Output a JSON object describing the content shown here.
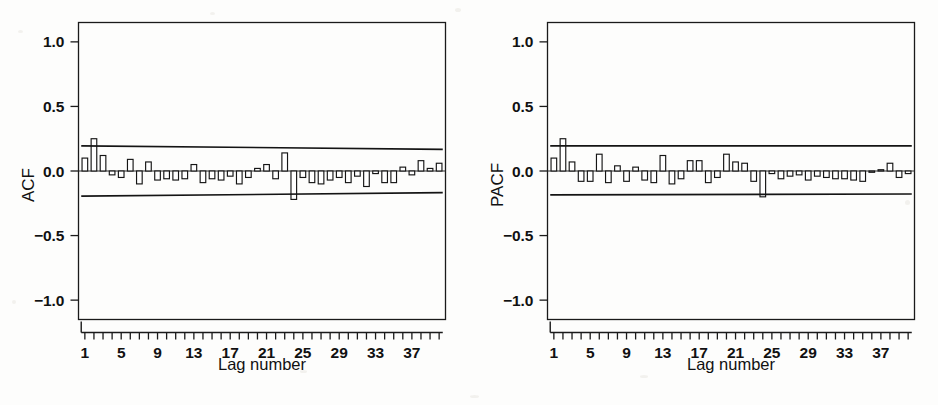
{
  "figure": {
    "background_color": "#fdfdfc",
    "ink_color": "#151515",
    "panel_count": 2
  },
  "chart_data": [
    {
      "type": "bar",
      "name": "acf",
      "title": "",
      "xlabel": "Lag number",
      "ylabel": "ACF",
      "ylim": [
        -1.15,
        1.15
      ],
      "ytick_values": [
        1.0,
        0.5,
        0.0,
        -0.5,
        -1.0
      ],
      "ytick_labels": [
        "1.0",
        "0.5",
        "0.0",
        "-0.5",
        "-1.0"
      ],
      "xlim": [
        0.3,
        40.7
      ],
      "xtick_values": [
        1,
        5,
        9,
        13,
        17,
        21,
        25,
        29,
        33,
        37
      ],
      "xtick_labels": [
        "1",
        "5",
        "9",
        "13",
        "17",
        "21",
        "25",
        "29",
        "33",
        "37"
      ],
      "minor_xticks_every": 1,
      "n_lags": 40,
      "grid": false,
      "legend": false,
      "zero_line": true,
      "confidence_band": {
        "label": "upper and lower confidence limits",
        "upper_start": 0.195,
        "upper_end": 0.168,
        "lower_start": -0.195,
        "lower_end": -0.168
      },
      "categories": [
        1,
        2,
        3,
        4,
        5,
        6,
        7,
        8,
        9,
        10,
        11,
        12,
        13,
        14,
        15,
        16,
        17,
        18,
        19,
        20,
        21,
        22,
        23,
        24,
        25,
        26,
        27,
        28,
        29,
        30,
        31,
        32,
        33,
        34,
        35,
        36,
        37,
        38,
        39,
        40
      ],
      "values": [
        0.1,
        0.25,
        0.12,
        -0.03,
        -0.05,
        0.09,
        -0.1,
        0.07,
        -0.07,
        -0.06,
        -0.07,
        -0.06,
        0.05,
        -0.09,
        -0.06,
        -0.07,
        -0.04,
        -0.1,
        -0.05,
        0.02,
        0.05,
        -0.06,
        0.14,
        -0.22,
        -0.05,
        -0.09,
        -0.1,
        -0.07,
        -0.05,
        -0.09,
        -0.04,
        -0.12,
        -0.02,
        -0.09,
        -0.09,
        0.03,
        -0.03,
        0.08,
        0.02,
        0.06
      ]
    },
    {
      "type": "bar",
      "name": "pacf",
      "title": "",
      "xlabel": "Lag number",
      "ylabel": "PACF",
      "ylim": [
        -1.15,
        1.15
      ],
      "ytick_values": [
        1.0,
        0.5,
        0.0,
        -0.5,
        -1.0
      ],
      "ytick_labels": [
        "1.0",
        "0.5",
        "0.0",
        "-0.5",
        "-1.0"
      ],
      "xlim": [
        0.3,
        40.7
      ],
      "xtick_values": [
        1,
        5,
        9,
        13,
        17,
        21,
        25,
        29,
        33,
        37
      ],
      "xtick_labels": [
        "1",
        "5",
        "9",
        "13",
        "17",
        "21",
        "25",
        "29",
        "33",
        "37"
      ],
      "minor_xticks_every": 1,
      "n_lags": 40,
      "grid": false,
      "legend": false,
      "zero_line": true,
      "confidence_band": {
        "label": "upper and lower confidence limits",
        "upper_start": 0.195,
        "upper_end": 0.195,
        "lower_start": -0.185,
        "lower_end": -0.178
      },
      "categories": [
        1,
        2,
        3,
        4,
        5,
        6,
        7,
        8,
        9,
        10,
        11,
        12,
        13,
        14,
        15,
        16,
        17,
        18,
        19,
        20,
        21,
        22,
        23,
        24,
        25,
        26,
        27,
        28,
        29,
        30,
        31,
        32,
        33,
        34,
        35,
        36,
        37,
        38,
        39,
        40
      ],
      "values": [
        0.1,
        0.25,
        0.07,
        -0.08,
        -0.08,
        0.13,
        -0.09,
        0.04,
        -0.08,
        0.03,
        -0.07,
        -0.09,
        0.12,
        -0.1,
        -0.06,
        0.08,
        0.08,
        -0.09,
        -0.05,
        0.13,
        0.07,
        0.06,
        -0.08,
        -0.2,
        -0.02,
        -0.06,
        -0.04,
        -0.03,
        -0.07,
        -0.04,
        -0.05,
        -0.06,
        -0.06,
        -0.07,
        -0.08,
        -0.01,
        0.01,
        0.06,
        -0.05,
        -0.02
      ]
    }
  ],
  "panels": [
    {
      "id": "acf",
      "y_axis_title": "ACF",
      "x_axis_title": "Lag number",
      "y_tick_labels": [
        "1.0",
        "0.5",
        "0.0",
        "-0.5",
        "-1.0"
      ],
      "x_tick_labels": [
        "1",
        "5",
        "9",
        "13",
        "17",
        "21",
        "25",
        "29",
        "33",
        "37"
      ]
    },
    {
      "id": "pacf",
      "y_axis_title": "PACF",
      "x_axis_title": "Lag number",
      "y_tick_labels": [
        "1.0",
        "0.5",
        "0.0",
        "-0.5",
        "-1.0"
      ],
      "x_tick_labels": [
        "1",
        "5",
        "9",
        "13",
        "17",
        "21",
        "25",
        "29",
        "33",
        "37"
      ]
    }
  ]
}
